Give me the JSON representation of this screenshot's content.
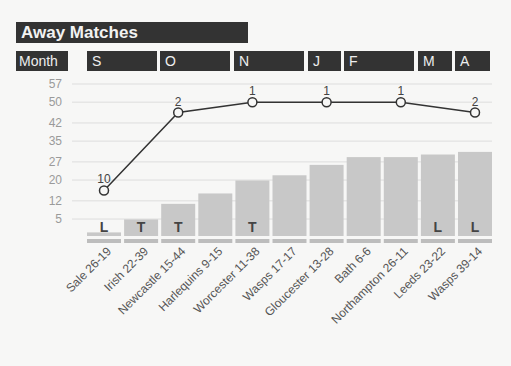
{
  "title": "Away Matches",
  "month_label": "Month",
  "months": [
    {
      "label": "S",
      "x": 87,
      "w": 70
    },
    {
      "label": "O",
      "x": 160,
      "w": 70
    },
    {
      "label": "N",
      "x": 234,
      "w": 70
    },
    {
      "label": "J",
      "x": 308,
      "w": 33
    },
    {
      "label": "F",
      "x": 344,
      "w": 70
    },
    {
      "label": "M",
      "x": 418,
      "w": 34
    },
    {
      "label": "A",
      "x": 455,
      "w": 35
    }
  ],
  "colors": {
    "dark": "#333333",
    "bar": "#c8c8c8",
    "line": "#333333",
    "grid": "#dddddd",
    "base": "#bdbdbd"
  },
  "chart_data": {
    "type": "bar+line",
    "title": "Away Matches",
    "xlabel": "",
    "ylabel": "",
    "yticks": [
      5,
      12,
      20,
      27,
      35,
      42,
      50,
      57
    ],
    "ylim": [
      0,
      57
    ],
    "categories": [
      "Sale 26-19",
      "Irish 22-39",
      "Newcastle 15-44",
      "Harlequins 9-15",
      "Worcester 11-38",
      "Wasps 17-17",
      "Gloucester 13-28",
      "Bath 6-6",
      "Northampton 26-11",
      "Leeds 23-22",
      "Wasps 39-14"
    ],
    "series": [
      {
        "name": "cumulative points (bars)",
        "type": "bar",
        "values": [
          1,
          6,
          12,
          16,
          21,
          23,
          27,
          30,
          30,
          31,
          32
        ]
      },
      {
        "name": "league position (line)",
        "type": "line",
        "points": [
          {
            "index": 0,
            "value": 16,
            "label": "10"
          },
          {
            "index": 2,
            "value": 46,
            "label": "2"
          },
          {
            "index": 4,
            "value": 50,
            "label": "1"
          },
          {
            "index": 6,
            "value": 50,
            "label": "1"
          },
          {
            "index": 8,
            "value": 50,
            "label": "1"
          },
          {
            "index": 10,
            "value": 46,
            "label": "2"
          }
        ]
      }
    ],
    "results": [
      "L",
      "T",
      "T",
      "",
      "T",
      "",
      "",
      "",
      "",
      "L",
      "L"
    ],
    "grid": true
  }
}
